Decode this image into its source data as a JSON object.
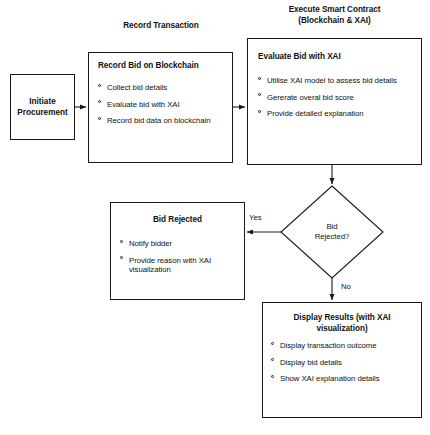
{
  "diagram": {
    "title_top_left": "Record Transaction",
    "title_top_right_line1": "Execute Smart Contract",
    "title_top_right_line2": "(Blockchain & XAI)",
    "nodes": {
      "initiate": {
        "type": "terminal",
        "label_line1": "Initiate",
        "label_line2": "Procurement"
      },
      "record_bid": {
        "type": "process",
        "title": "Record Bid on Blockchain",
        "bullets": [
          "Collect bid details",
          "Evaluate bid with XAI",
          "Record bid data on blockchain"
        ]
      },
      "evaluate_bid": {
        "type": "process",
        "title": "Evaluate Bid with XAI",
        "bullets": [
          "Utilise XAI model to assess bid details",
          "Gererate overal bid score",
          "Provide detailed explanation"
        ]
      },
      "decision": {
        "type": "decision",
        "label_line1": "Bid",
        "label_line2": "Rejected?"
      },
      "bid_rejected": {
        "type": "process",
        "title": "Bid Rejected",
        "bullets": [
          "Notify bidder",
          "Provide reason with XAI visualization"
        ]
      },
      "display_results": {
        "type": "process",
        "title_line1": "Display Results (with XAI",
        "title_line2": "visualization)",
        "bullets": [
          "Display transaction outcome",
          "Display bid details",
          "Show XAI explanation details"
        ]
      }
    },
    "edge_labels": {
      "yes": "Yes",
      "no": "No"
    },
    "colors": {
      "stroke": "#1a1a1a",
      "background": "#ffffff",
      "text": "#111111"
    }
  }
}
